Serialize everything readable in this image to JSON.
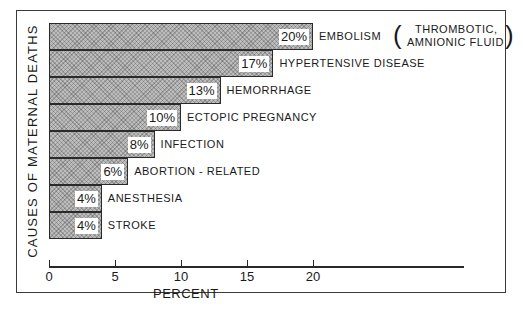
{
  "chart_data": {
    "type": "bar",
    "orientation": "horizontal",
    "title": "",
    "xlabel": "PERCENT",
    "ylabel": "CAUSES OF MATERNAL DEATHS",
    "xlim": [
      0,
      25
    ],
    "xticks": [
      "0",
      "5",
      "10",
      "15",
      "20"
    ],
    "grid": false,
    "legend": null,
    "categories": [
      "EMBOLISM (THROMBOTIC, AMNIONIC FLUID)",
      "HYPERTENSIVE DISEASE",
      "HEMORRHAGE",
      "ECTOPIC PREGNANCY",
      "INFECTION",
      "ABORTION - RELATED",
      "ANESTHESIA",
      "STROKE"
    ],
    "values": [
      20,
      17,
      13,
      10,
      8,
      6,
      4,
      4
    ],
    "value_labels": [
      "20%",
      "17%",
      "13%",
      "10%",
      "8%",
      "6%",
      "4%",
      "4%"
    ]
  },
  "labels": {
    "ylabel": "CAUSES OF MATERNAL DEATHS",
    "xlabel": "PERCENT",
    "embolism_main": "EMBOLISM",
    "embolism_sub1": "THROMBOTIC,",
    "embolism_sub2": "AMNIONIC FLUID",
    "paren_open": "(",
    "paren_close": ")"
  }
}
